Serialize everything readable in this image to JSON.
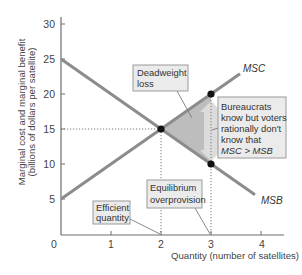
{
  "chart_data": {
    "type": "line",
    "title": "",
    "xlabel": "Quantity (number of satellites)",
    "ylabel_lines": [
      "Marginal cost and marginal benefit",
      "(billions of dollars per satellite)"
    ],
    "ylabel": "Marginal cost and marginal benefit (billions of dollars per satellite)",
    "xlim": [
      0,
      4.4
    ],
    "ylim": [
      0,
      31
    ],
    "xticks": [
      0,
      1,
      2,
      3,
      4
    ],
    "yticks": [
      0,
      5,
      10,
      15,
      20,
      25,
      30
    ],
    "grid": false,
    "legend": "none (curves labeled directly)",
    "series": [
      {
        "name": "MSC",
        "x": [
          0,
          3.58
        ],
        "y": [
          5,
          22.9
        ],
        "color": "#8c8c8c"
      },
      {
        "name": "MSB",
        "x": [
          0,
          3.88
        ],
        "y": [
          25,
          5.6
        ],
        "color": "#8c8c8c"
      }
    ],
    "points": [
      {
        "label": "equilibrium-efficient",
        "x": 2,
        "y": 15
      },
      {
        "label": "overprovision-msc",
        "x": 3,
        "y": 20
      },
      {
        "label": "overprovision-msb",
        "x": 3,
        "y": 10
      }
    ],
    "shaded_region": {
      "name": "Deadweight loss",
      "vertices": [
        [
          2,
          15
        ],
        [
          3,
          20
        ],
        [
          3,
          10
        ]
      ],
      "color": "#bdbdbd"
    },
    "reference_lines": [
      {
        "type": "horizontal",
        "y": 15,
        "x_from": 0,
        "x_to": 2,
        "style": "dotted"
      },
      {
        "type": "vertical",
        "x": 2,
        "y_from": 0,
        "y_to": 15,
        "style": "dotted"
      },
      {
        "type": "vertical",
        "x": 3,
        "y_from": 0,
        "y_to": 20,
        "style": "dotted"
      }
    ],
    "annotations": {
      "deadweight": [
        "Deadweight",
        "loss"
      ],
      "bureaucrats": [
        "Bureaucrats",
        "know but voters",
        "rationally don't",
        "know that",
        "MSC > MSB"
      ],
      "efficient": [
        "Efficient",
        "quantity"
      ],
      "equilibrium": [
        "Equilibrium",
        "overprovision"
      ]
    },
    "colors": {
      "curve": "#8c8c8c",
      "shaded": "#bdbdbd",
      "arrow": "#dcdcdc",
      "box_fill": "#ebebeb",
      "point": "#111111"
    }
  }
}
